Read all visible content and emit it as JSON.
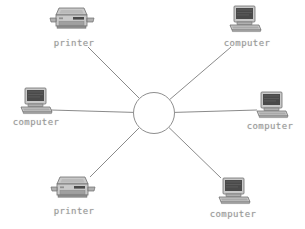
{
  "diagram": {
    "type": "network-topology",
    "background_color": "#ffffff",
    "line_color": "#7d7d7d",
    "label_color": "#9a9a9a",
    "hub": {
      "name": "central-hub",
      "shape": "circle",
      "cx": 154,
      "cy": 113,
      "r": 21,
      "fill": "#ffffff",
      "stroke": "#8e8e8e"
    },
    "nodes": [
      {
        "id": "printer-top-left",
        "label": "printer",
        "icon": "printer-icon",
        "icon_cx": 72,
        "icon_cy": 23,
        "label_cx": 74,
        "label_y": 38,
        "spoke_from_x": 88,
        "spoke_from_y": 47
      },
      {
        "id": "computer-top-right",
        "label": "computer",
        "icon": "computer-icon",
        "icon_cx": 245,
        "icon_cy": 21,
        "label_cx": 247,
        "label_y": 38,
        "spoke_from_x": 231,
        "spoke_from_y": 47
      },
      {
        "id": "computer-left",
        "label": "computer",
        "icon": "computer-icon",
        "icon_cx": 36,
        "icon_cy": 103,
        "label_cx": 36,
        "label_y": 117,
        "spoke_from_x": 51,
        "spoke_from_y": 110
      },
      {
        "id": "computer-right",
        "label": "computer",
        "icon": "computer-icon",
        "icon_cx": 272,
        "icon_cy": 107,
        "label_cx": 270,
        "label_y": 121,
        "spoke_from_x": 257,
        "spoke_from_y": 110
      },
      {
        "id": "printer-bottom-left",
        "label": "printer",
        "icon": "printer-icon",
        "icon_cx": 73,
        "icon_cy": 192,
        "label_cx": 74,
        "label_y": 206,
        "spoke_from_x": 90,
        "spoke_from_y": 177
      },
      {
        "id": "computer-bottom-right",
        "label": "computer",
        "icon": "computer-icon",
        "icon_cx": 234,
        "icon_cy": 193,
        "label_cx": 233,
        "label_y": 209,
        "spoke_from_x": 221,
        "spoke_from_y": 178
      }
    ],
    "icon_palette": {
      "screen_dark": "#4a4a4a",
      "screen_mid": "#5e5e5e",
      "body_light": "#c9c9c9",
      "body_mid": "#b0b0b0",
      "body_shadow": "#8f8f8f",
      "outline": "#6f6f6f"
    }
  }
}
